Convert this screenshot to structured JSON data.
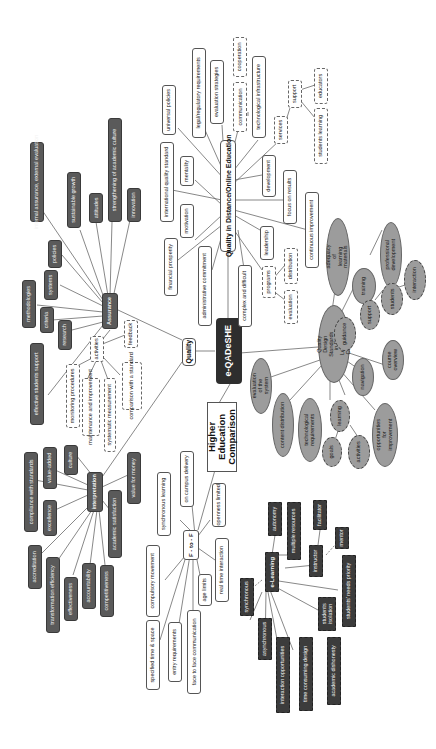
{
  "diagram": {
    "type": "mind-map",
    "orientation": "rotated-90-counterclockwise",
    "center": {
      "label": "e-QADeSHE"
    },
    "branches": {
      "quality": {
        "label": "Quality",
        "assurance": {
          "label": "Assurance",
          "items": [
            "internal assurance, external evaluation",
            "sustainable growth",
            "strengthening of academic culture",
            "policies",
            "attitudes",
            "innovation",
            "methodologies",
            "systems",
            "criteria",
            "research",
            "effective students support"
          ],
          "activities": {
            "label": "activities",
            "items": [
              "feedback",
              "monitoring procedures",
              "maintenance and improvement",
              "systematic measurement",
              "comparison with a standard"
            ]
          }
        },
        "interpretation": {
          "label": "interpretation",
          "items": [
            "compliance with standards",
            "value-added",
            "culture",
            "excellence",
            "accreditation",
            "transformation efficiency",
            "effectiveness",
            "accountability",
            "competitiveness",
            "academic satisfaction",
            "value for money"
          ]
        }
      },
      "quality_distance": {
        "label": "Quality in Distance/Online Education",
        "items": [
          "universal policies",
          "legal/regulatory requirements",
          "evaluation strategies",
          "communication",
          "cooperation",
          "technological infrastructure",
          "international quality standard",
          "mentality",
          "motivation",
          "financial prosperity",
          "administrative commitment",
          "development",
          "focus on results",
          "continuous improvement",
          "leadership",
          "complex and difficult"
        ],
        "services": {
          "label": "services",
          "support": {
            "label": "support",
            "items": [
              "educators",
              "students learning"
            ]
          }
        },
        "programs": {
          "label": "programs",
          "items": [
            "distribution",
            "evaluation"
          ]
        }
      },
      "quality_design": {
        "label": "Quality Design Standards in E-Learning Courses",
        "items": [
          "adequacy of learning materials",
          "training",
          "professional development",
          "guidance",
          "support",
          "students",
          "interaction",
          "course overview",
          "navigation",
          "evaluation of the system",
          "content distribution",
          "technological requirements",
          "learning",
          "goals",
          "activities",
          "opportunities for improvement"
        ]
      },
      "comparison": {
        "label": "Higher Education Comparison",
        "f2f": {
          "label": "F - to - F",
          "items": [
            "synchronous learning",
            "on campus delivery",
            "openness limited",
            "compulsory movement",
            "real time interaction",
            "age limits",
            "specified time & space",
            "entry requirements",
            "face to face communication"
          ]
        },
        "elearning": {
          "label": "e-Learning",
          "items": [
            "autonomy",
            "multiple resources",
            "facilitator",
            "instructor",
            "mentor",
            "synchronous",
            "asynchronous",
            "interaction opportunities",
            "time consuming design",
            "academic dishonesty",
            "students isolation",
            "students' needs priority"
          ]
        }
      }
    }
  }
}
